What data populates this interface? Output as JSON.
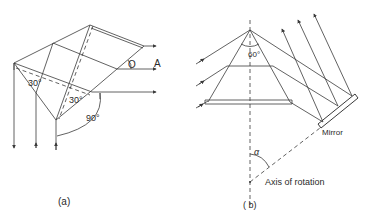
{
  "figure_a": {
    "caption": "(a)",
    "angle_label_1": "30°",
    "angle_label_2": "30°",
    "angle_label_3": "90°",
    "point_label_o": "O",
    "point_label_a": "A"
  },
  "figure_b": {
    "caption": "( b)",
    "apex_angle_label": "60°",
    "mirror_label": "Mirror",
    "alpha_label": "α",
    "axis_label": "Axis of rotation"
  },
  "colors": {
    "line": "#3a3a3a",
    "background": "#ffffff"
  }
}
